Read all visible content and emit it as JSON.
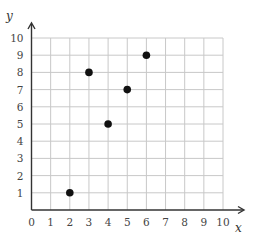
{
  "chart_data": {
    "type": "scatter",
    "title": "",
    "xlabel": "x",
    "ylabel": "y",
    "xlim": [
      0,
      10
    ],
    "ylim": [
      0,
      10
    ],
    "grid": true,
    "legend": null,
    "x_ticks": [
      0,
      1,
      2,
      3,
      4,
      5,
      6,
      7,
      8,
      9,
      10
    ],
    "y_ticks": [
      1,
      2,
      3,
      4,
      5,
      6,
      7,
      8,
      9,
      10
    ],
    "x_tick_labels": [
      "0",
      "1",
      "2",
      "3",
      "4",
      "5",
      "6",
      "7",
      "8",
      "9",
      "10"
    ],
    "y_tick_labels": [
      "1",
      "2",
      "3",
      "4",
      "5",
      "6",
      "7",
      "8",
      "9",
      "10"
    ],
    "points": [
      {
        "x": 2,
        "y": 1
      },
      {
        "x": 3,
        "y": 8
      },
      {
        "x": 4,
        "y": 5
      },
      {
        "x": 5,
        "y": 7
      },
      {
        "x": 6,
        "y": 9
      }
    ],
    "x": [
      2,
      3,
      4,
      5,
      6
    ],
    "y": [
      1,
      8,
      5,
      7,
      9
    ]
  },
  "colors": {
    "grid": "#c8c8c8",
    "axis": "#333333",
    "point": "#111111",
    "tick_text": "#444444"
  },
  "layout": {
    "origin_px": [
      31.5,
      210
    ],
    "x_step_px": 19.15,
    "y_step_px": 17.2,
    "x_arrow_end_px": 244,
    "y_arrow_end_px": 23,
    "point_radius_px": 3.8
  }
}
